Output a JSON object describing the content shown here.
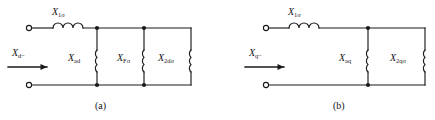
{
  "figure": {
    "type": "electrical-circuit-diagram",
    "stroke_color": "#1a1a1a",
    "background_color": "#ffffff"
  },
  "circuits": [
    {
      "id": "a",
      "caption": "(a)",
      "input_label_main": "X",
      "input_label_sub": "d−",
      "series_label_main": "X",
      "series_label_sub": "1σ",
      "shunt_branches": [
        {
          "main": "X",
          "sub": "ad"
        },
        {
          "main": "X",
          "sub": "Fσ"
        },
        {
          "main": "X",
          "sub": "2dσ"
        }
      ]
    },
    {
      "id": "b",
      "caption": "(b)",
      "input_label_main": "X",
      "input_label_sub": "q−",
      "series_label_main": "X",
      "series_label_sub": "1σ",
      "shunt_branches": [
        {
          "main": "X",
          "sub": "aq"
        },
        {
          "main": "X",
          "sub": "2qσ"
        }
      ]
    }
  ]
}
